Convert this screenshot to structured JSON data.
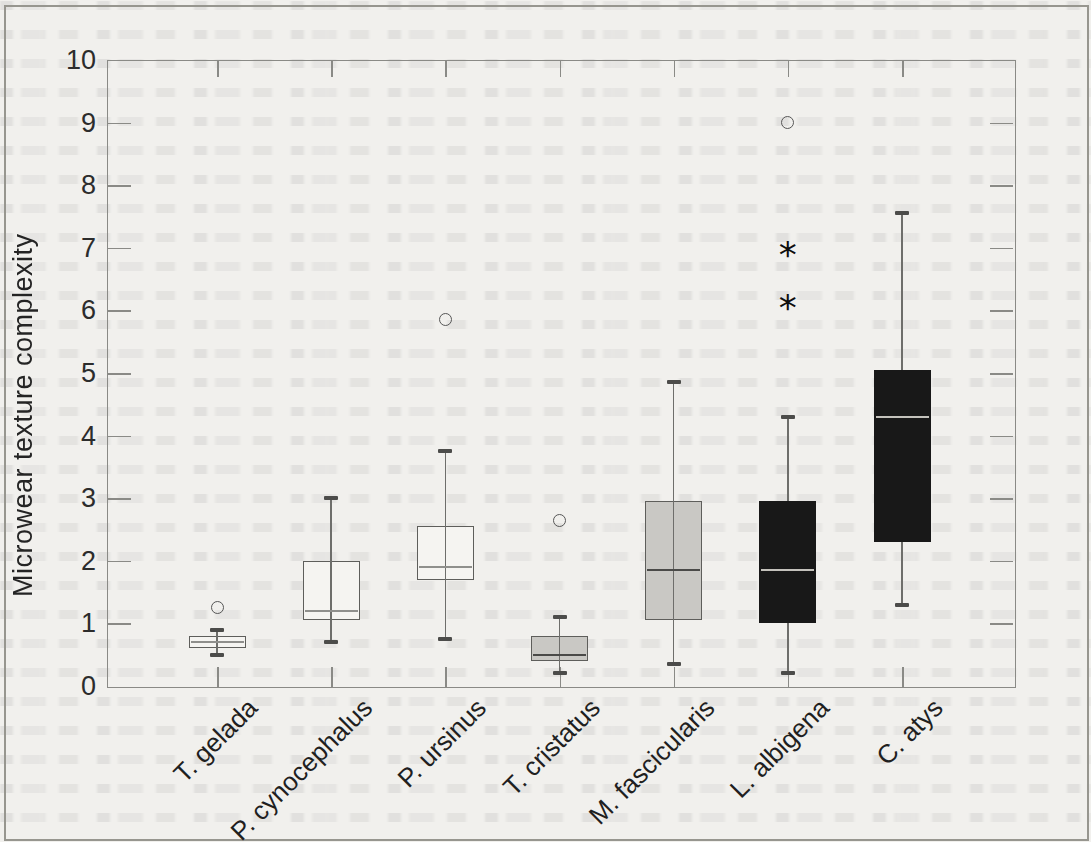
{
  "chart_data": {
    "type": "boxplot",
    "title": "",
    "xlabel": "",
    "ylabel": "Microwear texture complexity",
    "ylim": [
      0,
      10
    ],
    "yticks": [
      "0",
      "1",
      "2",
      "3",
      "4",
      "5",
      "6",
      "7",
      "8",
      "9",
      "10"
    ],
    "grid": false,
    "legend": "none",
    "categories": [
      "T. gelada",
      "P. cynocephalus",
      "P. ursinus",
      "T. cristatus",
      "M. fascicularis",
      "L. albigena",
      "C. atys"
    ],
    "series": [
      {
        "name": "T. gelada",
        "fill": "white",
        "whisker_low": 0.5,
        "q1": 0.6,
        "median": 0.7,
        "q3": 0.8,
        "whisker_high": 0.9,
        "outliers_circle": [
          1.25
        ],
        "outliers_asterisk": []
      },
      {
        "name": "P. cynocephalus",
        "fill": "white",
        "whisker_low": 0.7,
        "q1": 1.05,
        "median": 1.2,
        "q3": 2.0,
        "whisker_high": 3.0,
        "outliers_circle": [],
        "outliers_asterisk": []
      },
      {
        "name": "P. ursinus",
        "fill": "white",
        "whisker_low": 0.75,
        "q1": 1.7,
        "median": 1.9,
        "q3": 2.55,
        "whisker_high": 3.75,
        "outliers_circle": [
          5.85
        ],
        "outliers_asterisk": []
      },
      {
        "name": "T. cristatus",
        "fill": "grey",
        "whisker_low": 0.2,
        "q1": 0.4,
        "median": 0.5,
        "q3": 0.8,
        "whisker_high": 1.1,
        "outliers_circle": [
          2.65
        ],
        "outliers_asterisk": []
      },
      {
        "name": "M. fascicularis",
        "fill": "grey",
        "whisker_low": 0.35,
        "q1": 1.05,
        "median": 1.85,
        "q3": 2.95,
        "whisker_high": 4.85,
        "outliers_circle": [],
        "outliers_asterisk": []
      },
      {
        "name": "L. albigena",
        "fill": "black",
        "whisker_low": 0.2,
        "q1": 1.0,
        "median": 1.85,
        "q3": 2.95,
        "whisker_high": 4.3,
        "outliers_circle": [
          9.0
        ],
        "outliers_asterisk": [
          7.0,
          6.15
        ]
      },
      {
        "name": "C. atys",
        "fill": "black",
        "whisker_low": 1.3,
        "q1": 2.3,
        "median": 4.3,
        "q3": 5.05,
        "whisker_high": 7.55,
        "outliers_circle": [],
        "outliers_asterisk": []
      }
    ]
  },
  "palette": {
    "paper": "#f1f0ed",
    "box_white": "#f5f4f1",
    "box_grey": "#c9c8c4",
    "box_black": "#181818",
    "frame": "#8a8a86",
    "whisker_line": "#6e6e6b",
    "whisker_cap": "#4c4c4a",
    "box_border": "#5e5e5b",
    "median_on_white": "#8f8f8c",
    "median_on_grey": "#4a4a48",
    "median_on_black": "#c4c2bc",
    "text": "#242424"
  }
}
